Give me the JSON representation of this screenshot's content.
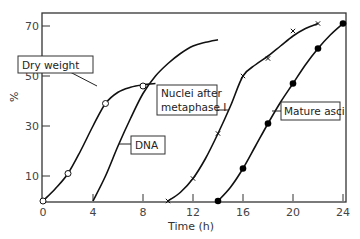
{
  "chart_data": {
    "type": "line",
    "title": "",
    "xlabel": "Time (h)",
    "ylabel": "%",
    "xlim": [
      0,
      24
    ],
    "ylim": [
      0,
      75
    ],
    "x_ticks": [
      0,
      4,
      8,
      12,
      16,
      20,
      24
    ],
    "y_ticks": [
      10,
      30,
      50,
      70
    ],
    "grid": false,
    "legend": "inline annotations",
    "series": [
      {
        "name": "Dry weight",
        "marker": "open-circle",
        "points": [
          [
            0,
            0
          ],
          [
            2,
            11
          ],
          [
            5,
            39
          ],
          [
            8,
            46
          ]
        ],
        "curve": [
          [
            0,
            0
          ],
          [
            1,
            5
          ],
          [
            2,
            11
          ],
          [
            3,
            20
          ],
          [
            4,
            30
          ],
          [
            5,
            39
          ],
          [
            6,
            43.5
          ],
          [
            7,
            45.5
          ],
          [
            8,
            46.5
          ],
          [
            9,
            47
          ]
        ]
      },
      {
        "name": "DNA",
        "marker": "none",
        "points": [],
        "curve": [
          [
            4,
            0
          ],
          [
            5,
            10
          ],
          [
            6,
            22
          ],
          [
            7,
            33
          ],
          [
            8,
            43
          ],
          [
            9,
            50
          ],
          [
            10,
            55
          ],
          [
            11,
            59
          ],
          [
            12,
            62
          ],
          [
            13,
            63.5
          ],
          [
            14,
            64.5
          ]
        ]
      },
      {
        "name": "Nuclei after metaphase I",
        "marker": "cross",
        "points": [
          [
            10,
            0
          ],
          [
            12,
            9
          ],
          [
            14,
            27
          ],
          [
            16,
            50
          ],
          [
            18,
            57
          ],
          [
            20,
            68
          ],
          [
            22,
            71
          ]
        ],
        "curve": [
          [
            10,
            0
          ],
          [
            11,
            3.5
          ],
          [
            12,
            9
          ],
          [
            13,
            17
          ],
          [
            14,
            27
          ],
          [
            15,
            38
          ],
          [
            16,
            50
          ],
          [
            17,
            54.5
          ],
          [
            18,
            58
          ],
          [
            19,
            62
          ],
          [
            20,
            66
          ],
          [
            21,
            69
          ],
          [
            22,
            71
          ]
        ]
      },
      {
        "name": "Mature asci",
        "marker": "filled-circle",
        "points": [
          [
            14,
            0
          ],
          [
            16,
            13
          ],
          [
            18,
            31
          ],
          [
            20,
            47
          ],
          [
            22,
            61
          ],
          [
            24,
            71
          ]
        ],
        "curve": [
          [
            14,
            0
          ],
          [
            15,
            5.5
          ],
          [
            16,
            13
          ],
          [
            17,
            22
          ],
          [
            18,
            31
          ],
          [
            19,
            39.5
          ],
          [
            20,
            47
          ],
          [
            21,
            54.5
          ],
          [
            22,
            61
          ],
          [
            23,
            66.5
          ],
          [
            24,
            71
          ]
        ]
      }
    ],
    "annotations": [
      {
        "label": "Dry weight",
        "box": [
          18,
          56,
          74,
          16
        ]
      },
      {
        "label": "DNA",
        "box": [
          132,
          150,
          33,
          18
        ]
      },
      {
        "label_line1": "Nuclei after",
        "label_line2": "metaphase I",
        "box": [
          157,
          85,
          66,
          30
        ]
      },
      {
        "label": "Mature asci",
        "box": [
          277,
          103,
          57,
          18
        ]
      }
    ]
  },
  "axes": {
    "x_title": "Time  (h)",
    "y_title": "%",
    "x_tick_labels": [
      "0",
      "4",
      "8",
      "12",
      "16",
      "20",
      "24"
    ],
    "y_tick_labels": [
      "10",
      "30",
      "50",
      "70"
    ]
  },
  "labels": {
    "dry_weight": "Dry weight",
    "dna": "DNA",
    "nuclei_line1": "Nuclei after",
    "nuclei_line2": "metaphase I",
    "mature_asci": "Mature asci"
  }
}
